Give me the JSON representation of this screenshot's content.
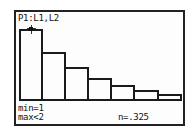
{
  "screen": {
    "plot_label": "P1:L1,L2",
    "trace": {
      "min_label": "min=1",
      "max_label": "max<2",
      "n_label": "n=.325"
    }
  },
  "chart_data": {
    "type": "bar",
    "title": "P1:L1,L2",
    "xlabel": "",
    "ylabel": "",
    "categories": [
      "[1,2)",
      "[2,3)",
      "[3,4)",
      "[4,5)",
      "[5,6)",
      "[6,7)",
      "[7,8)"
    ],
    "values": [
      0.325,
      0.225,
      0.16,
      0.11,
      0.08,
      0.055,
      0.035
    ],
    "grid": false,
    "legend": null,
    "selected_bar": 0,
    "annotations": [
      "min=1",
      "max<2",
      "n=.325"
    ]
  },
  "bars_px": [
    {
      "left": 19,
      "right": 43,
      "top": 29
    },
    {
      "left": 41,
      "right": 66,
      "top": 52
    },
    {
      "left": 64,
      "right": 89,
      "top": 67
    },
    {
      "left": 87,
      "right": 112,
      "top": 78
    },
    {
      "left": 110,
      "right": 135,
      "top": 85
    },
    {
      "left": 133,
      "right": 159,
      "top": 90
    },
    {
      "left": 157,
      "right": 182,
      "top": 94
    }
  ],
  "colors": {
    "background": "#fdfdfd",
    "ink": "#1a1a1a"
  }
}
